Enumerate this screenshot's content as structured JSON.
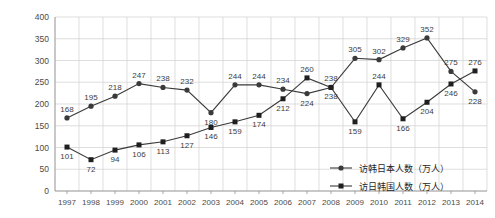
{
  "chart_data": {
    "type": "line",
    "title": "",
    "xlabel": "",
    "ylabel": "",
    "ylim": [
      0,
      400
    ],
    "ytick_step": 50,
    "grid": true,
    "legend_position": "inside-bottom-right",
    "categories": [
      "1997",
      "1998",
      "1999",
      "2000",
      "2001",
      "2002",
      "2003",
      "2004",
      "2005",
      "2006",
      "2007",
      "2008",
      "2009",
      "2010",
      "2011",
      "2012",
      "2013",
      "2014"
    ],
    "yticks": [
      "0",
      "50",
      "100",
      "150",
      "200",
      "250",
      "300",
      "350",
      "400"
    ],
    "series": [
      {
        "name": "访韩日本人数（万人）",
        "marker": "circle",
        "color": "#3a3a3a",
        "values": [
          168,
          195,
          218,
          247,
          238,
          232,
          180,
          244,
          244,
          234,
          224,
          238,
          305,
          302,
          329,
          352,
          275,
          228
        ]
      },
      {
        "name": "访日韩国人数（万人）",
        "marker": "square",
        "color": "#1f1f1f",
        "values": [
          101,
          72,
          94,
          106,
          113,
          127,
          146,
          159,
          174,
          212,
          260,
          238,
          159,
          244,
          166,
          204,
          246,
          276
        ]
      }
    ]
  },
  "legend": {
    "items": [
      {
        "label": "访韩日本人数（万人）",
        "marker": "circle"
      },
      {
        "label": "访日韩国人数（万人）",
        "marker": "square"
      }
    ]
  }
}
